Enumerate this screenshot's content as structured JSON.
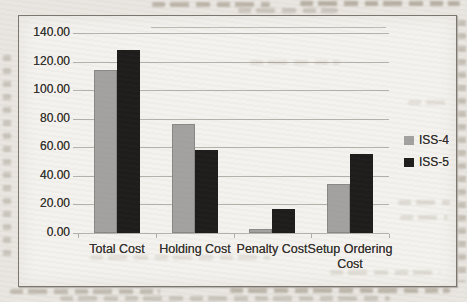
{
  "chart_data": {
    "type": "bar",
    "title": "",
    "xlabel": "",
    "ylabel": "",
    "categories": [
      "Total Cost",
      "Holding Cost",
      "Penalty Cost",
      "Setup Ordering Cost"
    ],
    "series": [
      {
        "name": "ISS-4",
        "color": "#a4a2a0",
        "values": [
          114,
          76.5,
          3,
          34
        ]
      },
      {
        "name": "ISS-5",
        "color": "#1e1d1c",
        "values": [
          128,
          58,
          16.5,
          55
        ]
      }
    ],
    "ylim": [
      0,
      140
    ],
    "ytick_step": 20,
    "ytick_labels": [
      "0.00",
      "20.00",
      "40.00",
      "60.00",
      "80.00",
      "100.00",
      "120.00",
      "140.00"
    ],
    "grid": true,
    "legend_position": "right"
  }
}
